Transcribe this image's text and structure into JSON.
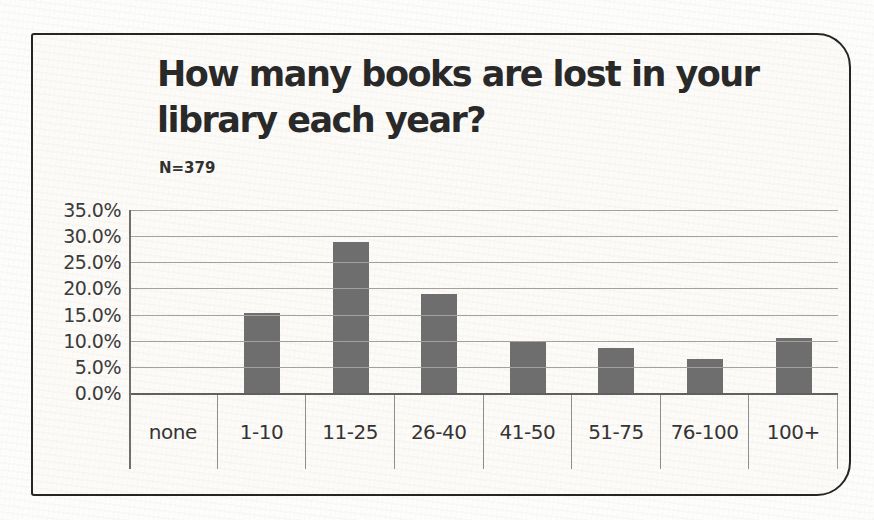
{
  "header": {
    "title_lines": [
      "How many books are lost in your",
      "library each year?"
    ],
    "sample_size": "N=379"
  },
  "chart_data": {
    "type": "bar",
    "title": "How many books are lost in your library each year?",
    "subtitle": "N=379",
    "categories": [
      "none",
      "1-10",
      "11-25",
      "26-40",
      "41-50",
      "51-75",
      "76-100",
      "100+"
    ],
    "values": [
      0.0,
      15.3,
      28.8,
      19.0,
      9.8,
      8.7,
      6.6,
      10.5
    ],
    "value_unit": "%",
    "xlabel": "",
    "ylabel": "",
    "ylim": [
      0,
      35
    ],
    "y_tick_step": 5,
    "y_tick_labels": [
      "35.0%",
      "30.0%",
      "25.0%",
      "20.0%",
      "15.0%",
      "10.0%",
      "5.0%",
      "0.0%"
    ],
    "grid": true,
    "legend": "none",
    "bar_color": "#6e6e6e"
  },
  "colors": {
    "bar": "#6e6e6e",
    "frame_border": "#242424",
    "frame_background": "#fcfbf8",
    "gridline": "#a5a29d",
    "zero_line": "#606060",
    "divider": "#8f8f8f",
    "title_text": "#282828",
    "axis_text": "#3a3a3a"
  }
}
